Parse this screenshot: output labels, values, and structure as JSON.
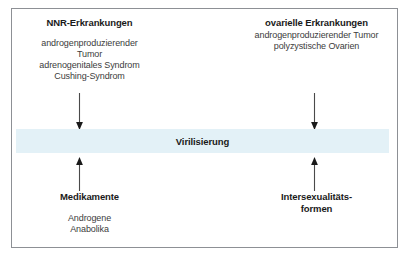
{
  "figure": {
    "band": {
      "label": "Virilisierung",
      "color": "#e3f1f7"
    },
    "blocks": {
      "nnr": {
        "heading": "NNR-Erkrankungen",
        "lines": "androgenproduzierender\nTumor\nadrenogenitales Syndrom\nCushing-Syndrom"
      },
      "ovarielle": {
        "heading": "ovarielle Erkrankungen",
        "lines": "androgenproduzierender Tumor\npolyzystische Ovarien"
      },
      "medikamente": {
        "heading": "Medikamente",
        "lines": "Androgene\nAnabolika"
      },
      "intersex": {
        "heading": "Intersexualitäts-\nformen",
        "lines": ""
      }
    },
    "arrows": {
      "nnr_down": "arrow-down-icon",
      "ovarielle_down": "arrow-down-icon",
      "medikamente_up": "arrow-up-icon",
      "intersex_up": "arrow-up-icon"
    }
  }
}
